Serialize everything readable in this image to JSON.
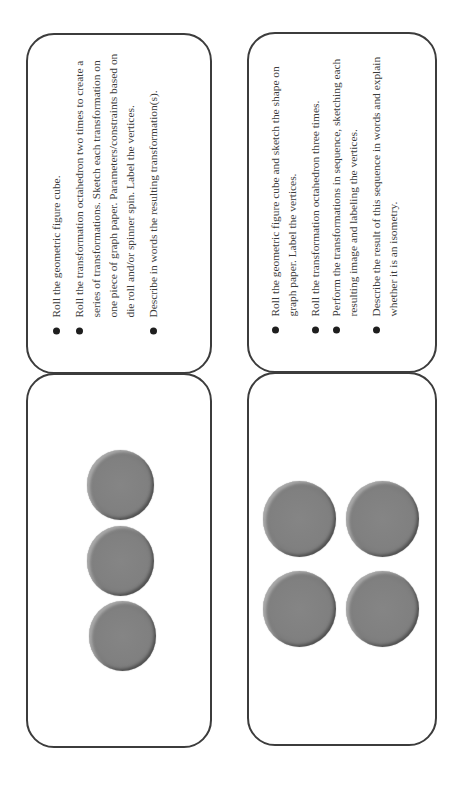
{
  "cards": [
    {
      "id": "card-1",
      "type": "instructions",
      "items": [
        "Roll the geometric figure cube.",
        "Roll the transformation octahedron two times to create a series of transformations. Sketch each transformation on one piece of graph paper. Parameters/constraints based on die roll and/or spinner spin. Label the vertices.",
        "Describe in words the resulting transformation(s)."
      ]
    },
    {
      "id": "card-2",
      "type": "instructions",
      "items": [
        "Roll the geometric figure cube and sketch the shape on graph paper. Label the vertices.",
        "Roll the transformation octahedron three times.",
        "Perform the transformations in sequence, sketching each resulting image and labeling the vertices.",
        "Describe the result of this sequence in words and explain whether it is an isometry."
      ]
    },
    {
      "id": "card-3",
      "type": "dots",
      "dot_count": 3,
      "dot_color": "#808080"
    },
    {
      "id": "card-4",
      "type": "dots",
      "dot_count": 4,
      "dot_color": "#808080"
    }
  ],
  "colors": {
    "card_border": "#3c3c3c",
    "text": "#3a3a3a",
    "bullet": "#1e1e1e",
    "dot_fill": "#808080"
  }
}
